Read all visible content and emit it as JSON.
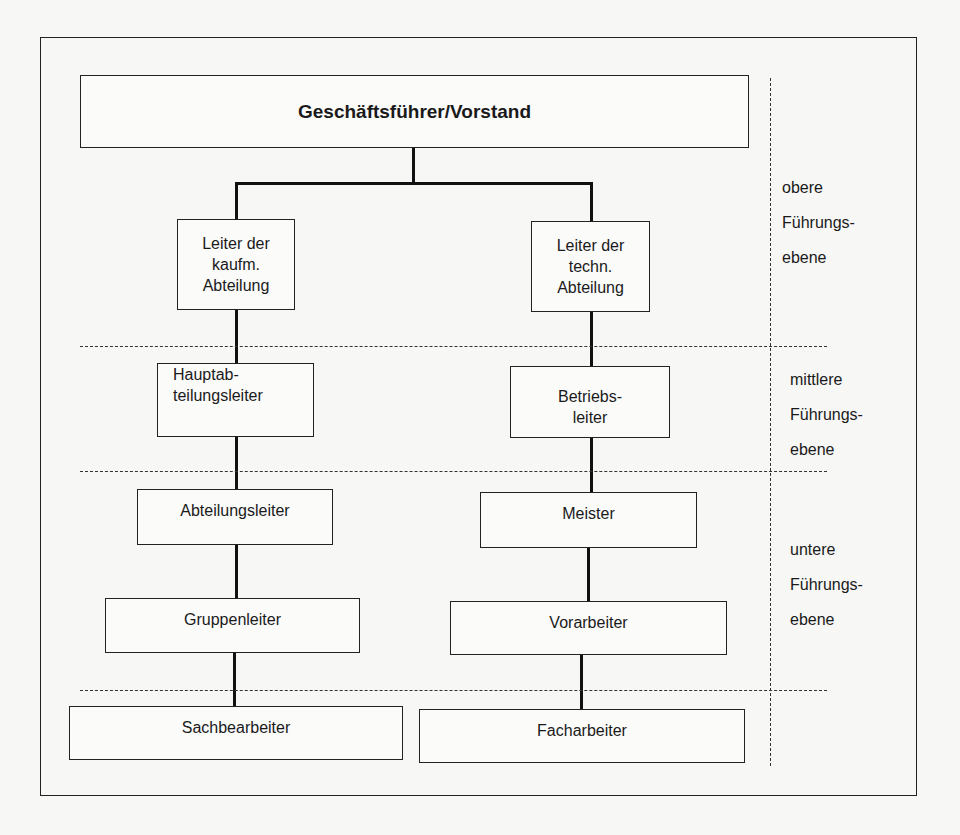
{
  "diagram": {
    "type": "org-chart",
    "top": "Geschäftsführer/Vorstand",
    "left_column": [
      "Leiter der\nkaufm.\nAbteilung",
      "Hauptab-\nteilungsleiter",
      "Abteilungsleiter",
      "Gruppenleiter",
      "Sachbearbeiter"
    ],
    "right_column": [
      "Leiter der\ntechn.\nAbteilung",
      "Betriebs-\nleiter",
      "Meister",
      "Vorarbeiter",
      "Facharbeiter"
    ],
    "levels": [
      {
        "line1": "obere",
        "line2": "Führungs-",
        "line3": "ebene"
      },
      {
        "line1": "mittlere",
        "line2": "Führungs-",
        "line3": "ebene"
      },
      {
        "line1": "untere",
        "line2": "Führungs-",
        "line3": "ebene"
      }
    ]
  },
  "labels": {
    "top": "Geschäftsführer/Vorstand",
    "l1a": "Leiter der",
    "l1b": "kaufm.",
    "l1c": "Abteilung",
    "r1a": "Leiter der",
    "r1b": "techn.",
    "r1c": "Abteilung",
    "l2a": "Hauptab-",
    "l2b": "teilungsleiter",
    "r2a": "Betriebs-",
    "r2b": "leiter",
    "l3": "Abteilungsleiter",
    "r3": "Meister",
    "l4": "Gruppenleiter",
    "r4": "Vorarbeiter",
    "l5": "Sachbearbeiter",
    "r5": "Facharbeiter"
  }
}
